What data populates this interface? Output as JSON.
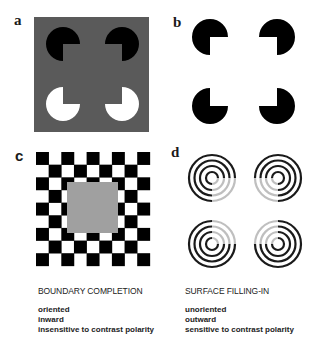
{
  "panels": {
    "a": {
      "label": "a",
      "description": "Kanizsa square with black and white pacman inducers on gray background"
    },
    "b": {
      "label": "b",
      "description": "Kanizsa illusory square with black pacman inducers on white background"
    },
    "c": {
      "label": "c",
      "description": "Checkerboard surrounding a gray square"
    },
    "d": {
      "label": "d",
      "description": "Concentric ring groups with faded inner quadrants"
    }
  },
  "colors": {
    "panel_a_background": "#5a5a5a",
    "inducer_dark": "#000000",
    "inducer_light": "#ffffff",
    "checker_dark": "#000000",
    "checker_gray": "#a0a0a0",
    "ring": "#1a1a1a"
  },
  "captions": {
    "left": {
      "heading": "BOUNDARY COMPLETION",
      "items": [
        "oriented",
        "inward",
        "insensitive to contrast polarity"
      ]
    },
    "right": {
      "heading": "SURFACE FILLING-IN",
      "items": [
        "unoriented",
        "outward",
        "sensitive to contrast polarity"
      ]
    }
  }
}
